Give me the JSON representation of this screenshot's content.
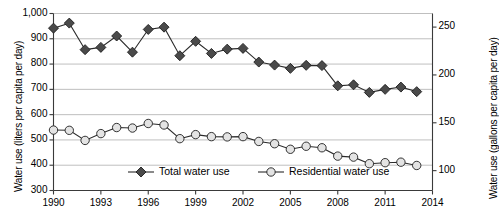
{
  "chart_data": {
    "type": "line",
    "title": "",
    "xlabel": "",
    "ylabel": "Water use (liters per capita per day)",
    "ylabel_secondary": "Water use (gallons per capita per day)",
    "x": [
      1990,
      1991,
      1992,
      1993,
      1994,
      1995,
      1996,
      1997,
      1998,
      1999,
      2000,
      2001,
      2002,
      2003,
      2004,
      2005,
      2006,
      2007,
      2008,
      2009,
      2010,
      2011,
      2012,
      2013
    ],
    "xlim": [
      1990,
      2014
    ],
    "ylim": [
      300,
      1000
    ],
    "ylim_secondary": [
      79.25,
      264.2
    ],
    "yticks": [
      "300",
      "400",
      "500",
      "600",
      "700",
      "800",
      "900",
      "1,000"
    ],
    "ytick_values": [
      300,
      400,
      500,
      600,
      700,
      800,
      900,
      1000
    ],
    "yticks_secondary": [
      "100",
      "150",
      "200",
      "250"
    ],
    "ytick_values_secondary": [
      100,
      150,
      200,
      250
    ],
    "xticks": [
      "1990",
      "1993",
      "1996",
      "1999",
      "2002",
      "2005",
      "2008",
      "2011",
      "2014"
    ],
    "xtick_values": [
      1990,
      1993,
      1996,
      1999,
      2002,
      2005,
      2008,
      2011,
      2014
    ],
    "grid": true,
    "grid_axis": "y",
    "legend_position": "inside-bottom-center",
    "series": [
      {
        "name": "Total water use",
        "marker": "diamond",
        "marker_fill": "#4a4a4a",
        "line_color": "#2b2b2b",
        "axis": "left",
        "values": [
          942,
          962,
          857,
          866,
          911,
          847,
          937,
          946,
          833,
          890,
          842,
          859,
          862,
          808,
          796,
          783,
          795,
          794,
          714,
          718,
          688,
          700,
          709,
          691
        ]
      },
      {
        "name": "Residential water use",
        "marker": "circle",
        "marker_fill": "#e3e3e3",
        "line_color": "#2b2b2b",
        "axis": "left",
        "values": [
          539,
          538,
          498,
          525,
          549,
          547,
          565,
          559,
          505,
          521,
          513,
          512,
          513,
          494,
          485,
          463,
          475,
          469,
          436,
          432,
          406,
          410,
          412,
          399
        ]
      }
    ]
  },
  "legend": {
    "items": [
      {
        "label": "Total water use",
        "marker": "diamond"
      },
      {
        "label": "Residential water use",
        "marker": "circle"
      }
    ]
  }
}
